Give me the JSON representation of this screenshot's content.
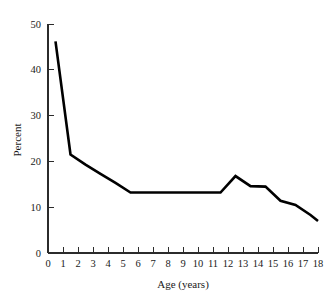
{
  "chart_data": {
    "type": "line",
    "title": "",
    "xlabel": "Age (years)",
    "ylabel": "Percent",
    "xlim": [
      0,
      18
    ],
    "ylim": [
      0,
      50
    ],
    "grid": false,
    "legend": null,
    "x_ticks": [
      0,
      1,
      2,
      3,
      4,
      5,
      6,
      7,
      8,
      9,
      10,
      11,
      12,
      13,
      14,
      15,
      16,
      17,
      18
    ],
    "x_tick_labels": [
      "0",
      "1",
      "2",
      "3",
      "4",
      "5",
      "6",
      "7",
      "8",
      "9",
      "10",
      "11",
      "12",
      "13",
      "14",
      "15",
      "16",
      "17",
      "18"
    ],
    "y_ticks": [
      0,
      10,
      20,
      30,
      40,
      50
    ],
    "y_tick_labels": [
      "0",
      "10",
      "20",
      "30",
      "40",
      "50"
    ],
    "series": [
      {
        "name": "Percent by age",
        "color": "#000000",
        "x": [
          0.5,
          1.5,
          2.5,
          3.5,
          4.5,
          5.5,
          6.5,
          7.5,
          8.5,
          9.5,
          10.5,
          11.5,
          12.5,
          13.5,
          14.5,
          15.5,
          16.5,
          17.5,
          18.0
        ],
        "y": [
          46.2,
          21.5,
          19.3,
          17.3,
          15.3,
          13.2,
          13.2,
          13.2,
          13.2,
          13.2,
          13.2,
          13.2,
          16.8,
          14.6,
          14.5,
          11.4,
          10.5,
          8.3,
          7.0
        ]
      }
    ]
  },
  "style": {
    "line_color": "#000000",
    "axis_color": "#2b2b2b",
    "text_color": "#1a1a1a",
    "background": "#ffffff"
  }
}
